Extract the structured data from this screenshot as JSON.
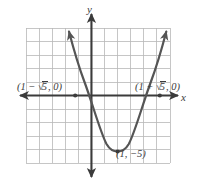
{
  "figure": {
    "type": "cartesian-graph",
    "background_color": "#ffffff",
    "grid_color": "#b8b8b8",
    "axis_color": "#3b3b3b",
    "curve_color": "#555555",
    "label_color": "#3b3b3b"
  },
  "axes": {
    "x_label": "x",
    "y_label": "y",
    "x_range": [
      -5,
      6
    ],
    "y_range": [
      -5,
      5
    ],
    "grid_step": 1,
    "grid_visible": true,
    "tick_labels_visible": false
  },
  "labels": {
    "left_intercept": {
      "prefix": "(1 − ",
      "radicand": "5",
      "suffix": ", 0)",
      "full_text": "(1 − √5, 0)"
    },
    "right_intercept": {
      "prefix": "(1 + ",
      "radicand": "5",
      "suffix": ", 0)",
      "full_text": "(1 + √5, 0)"
    },
    "vertex": {
      "full_text": "(1, −5)"
    }
  },
  "chart_data": {
    "type": "line",
    "title": "",
    "xlabel": "x",
    "ylabel": "y",
    "xlim": [
      -5,
      6
    ],
    "ylim": [
      -5,
      5
    ],
    "grid": true,
    "legend": null,
    "series": [
      {
        "name": "parabola",
        "equation": "y = (x - 1)^2 - 5",
        "color": "#555555",
        "arrowheads": [
          "start",
          "end"
        ],
        "x": [
          -1.28,
          -1.0,
          -0.5,
          0.0,
          0.5,
          1.0,
          1.5,
          2.0,
          2.5,
          3.0,
          3.28
        ],
        "y": [
          0.2,
          -0.99,
          -2.75,
          -4.0,
          -4.75,
          -5.0,
          -4.75,
          -4.0,
          -2.75,
          -0.99,
          0.2
        ]
      }
    ],
    "annotations": [
      {
        "name": "left-intercept",
        "x": -1.236,
        "y": 0,
        "text": "(1 − √5, 0)",
        "marker": true
      },
      {
        "name": "right-intercept",
        "x": 3.236,
        "y": 0,
        "text": "(1 + √5, 0)",
        "marker": true
      },
      {
        "name": "vertex",
        "x": 1,
        "y": -5,
        "text": "(1, −5)",
        "marker": true
      }
    ]
  }
}
